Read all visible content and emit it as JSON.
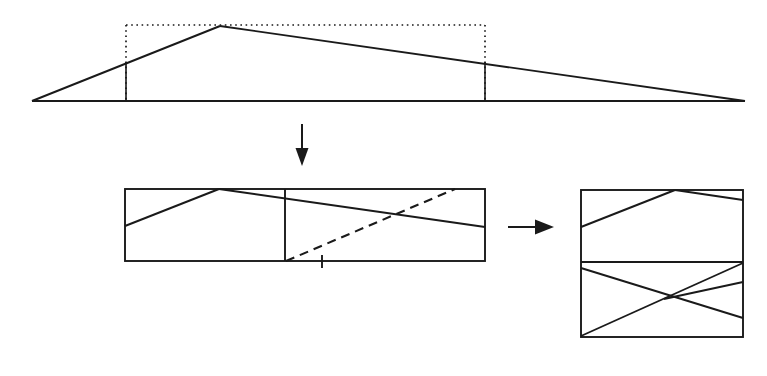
{
  "figure": {
    "background_color": "#ffffff",
    "stroke_color": "#1a1a1a",
    "canvas": {
      "width": 767,
      "height": 376
    }
  },
  "chart_data": {
    "type": "diagram",
    "panels": [
      {
        "id": "panel-triangle",
        "label": "source triangle with inscribed dotted rectangle",
        "baseline": {
          "x1": 32,
          "y1": 101,
          "x2": 745,
          "y2": 101
        },
        "apex": {
          "x": 220,
          "y": 26
        },
        "left_vertex": {
          "x": 32,
          "y": 101
        },
        "right_vertex": {
          "x": 745,
          "y": 101
        },
        "dotted_rect": {
          "x": 126,
          "y": 25,
          "width": 359,
          "height": 76
        },
        "vertical_cuts": [
          {
            "x": 126,
            "y_top": 62,
            "y_bottom": 101
          },
          {
            "x": 485,
            "y_top": 62,
            "y_bottom": 101
          }
        ]
      },
      {
        "id": "panel-middle",
        "label": "unfolded two-cell strip with solid and dashed diagonals",
        "rect": {
          "x": 125,
          "y": 189,
          "width": 360,
          "height": 72
        },
        "divider_x": 285,
        "solid_diagonals": [
          {
            "x1": 125,
            "y1": 226,
            "x2": 219,
            "y2": 189
          },
          {
            "x1": 219,
            "y1": 189,
            "x2": 485,
            "y2": 227
          }
        ],
        "dashed_diagonal": {
          "x1": 286,
          "y1": 261,
          "x2": 455,
          "y2": 189
        },
        "tick_mark": {
          "x": 322,
          "y_top": 255,
          "y_bottom": 268
        }
      },
      {
        "id": "panel-right",
        "label": "stacked two-row result block",
        "rect": {
          "x": 581,
          "y": 190,
          "width": 162,
          "height": 147
        },
        "divider_y": 262,
        "upper_lines": [
          {
            "x1": 581,
            "y1": 227,
            "x2": 675,
            "y2": 190
          },
          {
            "x1": 675,
            "y1": 190,
            "x2": 743,
            "y2": 200
          }
        ],
        "lower_lines": [
          {
            "x1": 581,
            "y1": 268,
            "x2": 743,
            "y2": 318
          },
          {
            "x1": 581,
            "y1": 336,
            "x2": 743,
            "y2": 263
          },
          {
            "x1": 664,
            "y1": 299,
            "x2": 743,
            "y2": 282
          }
        ]
      }
    ],
    "arrows": [
      {
        "id": "arrow-down",
        "direction": "down",
        "from": {
          "x": 302,
          "y": 124
        },
        "to": {
          "x": 302,
          "y": 166
        }
      },
      {
        "id": "arrow-right",
        "direction": "right",
        "from": {
          "x": 508,
          "y": 227
        },
        "to": {
          "x": 554,
          "y": 227
        }
      }
    ],
    "annotations": [],
    "legend": [],
    "xlabel": "",
    "ylabel": ""
  }
}
